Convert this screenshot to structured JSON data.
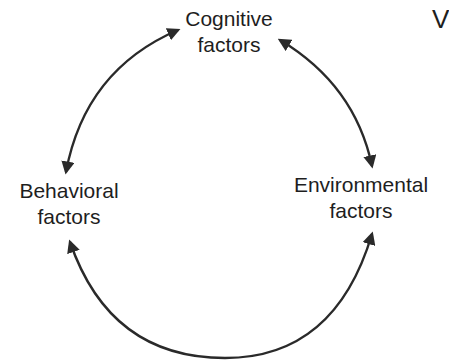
{
  "diagram": {
    "type": "cycle",
    "nodes": [
      {
        "id": "cognitive",
        "line1": "Cognitive",
        "line2": "factors"
      },
      {
        "id": "behavioral",
        "line1": "Behavioral",
        "line2": "factors"
      },
      {
        "id": "environmental",
        "line1": "Environmental",
        "line2": "factors"
      }
    ],
    "edges": [
      {
        "from": "cognitive",
        "to": "behavioral",
        "bidirectional": true
      },
      {
        "from": "cognitive",
        "to": "environmental",
        "bidirectional": true
      },
      {
        "from": "behavioral",
        "to": "environmental",
        "bidirectional": true
      }
    ],
    "cut_off_text": "V",
    "stroke_color": "#2a2a2a"
  }
}
